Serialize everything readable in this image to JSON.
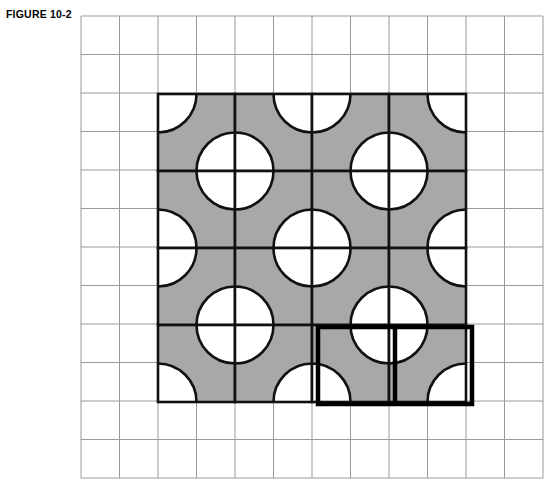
{
  "figure": {
    "label": "FIGURE 10-2",
    "caption_position": "top-left"
  },
  "colors": {
    "shade_gray": "#a8a8a8",
    "background_white": "#ffffff",
    "light_grid_line": "#9a9a9a",
    "tile_outline": "#111111",
    "highlight_outline": "#000000",
    "label_text": "#000000"
  },
  "grid": {
    "name": "light-graph-grid",
    "columns": 12,
    "rows": 12,
    "cell_size_px": 38.5,
    "origin_x_px": 81,
    "origin_y_px": 16,
    "line_width_px": 1,
    "grid_on": true
  },
  "pattern": {
    "name": "quarter-circle-tessellation",
    "tile_columns": 4,
    "tile_rows": 4,
    "tile_size_px": 77,
    "origin_x_px": 158,
    "origin_y_px": 94,
    "tile_outline_width_px": 2.6,
    "arc_radius_px": 38.5,
    "tile_types": {
      "A": {
        "description": "white quarter-circle at top-left and bottom-right on gray field",
        "arc_corners": [
          "top-left",
          "bottom-right"
        ]
      },
      "B": {
        "description": "white quarter-circle at top-right and bottom-left on gray field",
        "arc_corners": [
          "top-right",
          "bottom-left"
        ]
      }
    },
    "tile_layout": [
      [
        "A",
        "B",
        "A",
        "B"
      ],
      [
        "B",
        "A",
        "B",
        "A"
      ],
      [
        "A",
        "B",
        "A",
        "B"
      ],
      [
        "B",
        "A",
        "B",
        "A"
      ]
    ]
  },
  "highlight": {
    "name": "emphasized-region",
    "description": "bold rectangle outlining two tiles in the bottom row",
    "tile_row": 3,
    "tile_col_start": 2,
    "tile_col_span": 2,
    "tile_row_span": 1,
    "x_px": 318,
    "y_px": 327,
    "width_px": 154,
    "height_px": 77,
    "stroke_width_px": 4.5
  }
}
